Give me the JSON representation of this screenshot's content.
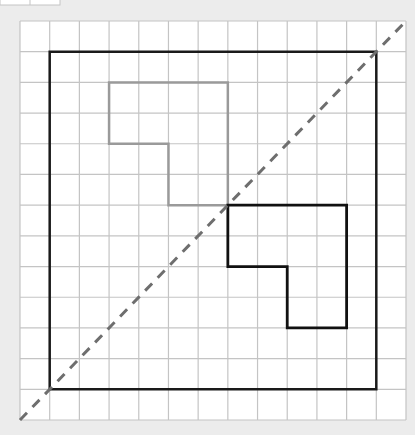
{
  "figure": {
    "grid": {
      "x0": 20,
      "y0": 21,
      "x1": 406,
      "y1": 420,
      "cols": 13,
      "rows": 13,
      "line_color": "#c4c4c4",
      "bg": "#ffffff"
    },
    "top_fragment": {
      "x0": 0,
      "y0": 0,
      "x1": 60,
      "y1": 5,
      "divider_x": 30
    },
    "outer_square": {
      "points": [
        [
          1,
          1
        ],
        [
          12,
          1
        ],
        [
          12,
          12
        ],
        [
          1,
          12
        ]
      ],
      "color": "#1a1a1a",
      "width": 2.5
    },
    "gray_shape": {
      "points": [
        [
          3,
          2
        ],
        [
          7,
          2
        ],
        [
          7,
          6
        ],
        [
          5,
          6
        ],
        [
          5,
          4
        ],
        [
          3,
          4
        ]
      ],
      "color": "#9a9a9a",
      "width": 2.5
    },
    "black_shape": {
      "points": [
        [
          7,
          6
        ],
        [
          11,
          6
        ],
        [
          11,
          10
        ],
        [
          9,
          10
        ],
        [
          9,
          8
        ],
        [
          7,
          8
        ]
      ],
      "color": "#111111",
      "width": 2.8
    },
    "diagonal": {
      "from": [
        0,
        13
      ],
      "to": [
        13,
        0
      ],
      "color": "#6e6e6e",
      "width": 3,
      "dash": "10,8"
    },
    "page_bg": "#ececec"
  }
}
